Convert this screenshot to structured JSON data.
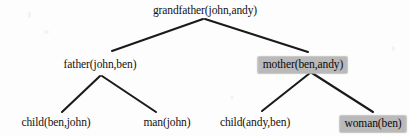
{
  "diagram": {
    "type": "proof-tree",
    "background_color": "#fdfdfd",
    "edge_color": "#1a1a1a",
    "highlight_color": "#b9b9b9",
    "text_color": "#111111",
    "nodes": [
      {
        "id": "root",
        "label": "grandfather(john,andy)",
        "x": 205,
        "y": 4,
        "level": 0,
        "highlighted": false
      },
      {
        "id": "father",
        "label": "father(john,ben)",
        "x": 100,
        "y": 58,
        "level": 1,
        "highlighted": false
      },
      {
        "id": "mother",
        "label": "mother(ben,andy)",
        "x": 303,
        "y": 57,
        "level": 1,
        "highlighted": true
      },
      {
        "id": "child-ben-john",
        "label": "child(ben,john)",
        "x": 56,
        "y": 116,
        "level": 2,
        "highlighted": false
      },
      {
        "id": "man-john",
        "label": "man(john)",
        "x": 167,
        "y": 116,
        "level": 2,
        "highlighted": false
      },
      {
        "id": "child-andy-ben",
        "label": "child(andy,ben)",
        "x": 255,
        "y": 116,
        "level": 2,
        "highlighted": false
      },
      {
        "id": "woman-ben",
        "label": "woman(ben)",
        "x": 373,
        "y": 116,
        "level": 2,
        "highlighted": true
      }
    ],
    "edges": [
      {
        "from": "root",
        "to": "father",
        "x1": 203,
        "y1": 19,
        "x2": 112,
        "y2": 51
      },
      {
        "from": "root",
        "to": "mother",
        "x1": 205,
        "y1": 19,
        "x2": 308,
        "y2": 52
      },
      {
        "from": "father",
        "to": "child-ben-john",
        "x1": 100,
        "y1": 76,
        "x2": 62,
        "y2": 112
      },
      {
        "from": "father",
        "to": "man-john",
        "x1": 102,
        "y1": 76,
        "x2": 156,
        "y2": 112
      },
      {
        "from": "mother",
        "to": "child-andy-ben",
        "x1": 310,
        "y1": 73,
        "x2": 262,
        "y2": 111
      },
      {
        "from": "mother",
        "to": "woman-ben",
        "x1": 312,
        "y1": 73,
        "x2": 373,
        "y2": 112
      }
    ]
  }
}
